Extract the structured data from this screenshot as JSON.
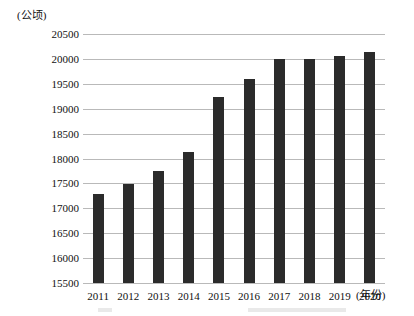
{
  "chart_data": {
    "type": "bar",
    "title": "",
    "xlabel": "(年份)",
    "ylabel": "(公顷)",
    "categories": [
      "2011",
      "2012",
      "2013",
      "2014",
      "2015",
      "2016",
      "2017",
      "2018",
      "2019",
      "2020"
    ],
    "values": [
      17280,
      17490,
      17740,
      18140,
      19230,
      19600,
      19990,
      19990,
      20060,
      20140
    ],
    "ylim": [
      15500,
      20500
    ],
    "ytick_labels": [
      "20500",
      "20000",
      "19500",
      "19000",
      "18500",
      "18000",
      "17500",
      "17000",
      "16500",
      "16000",
      "15500"
    ],
    "ytick_values": [
      20500,
      20000,
      19500,
      19000,
      18500,
      18000,
      17500,
      17000,
      16500,
      16000,
      15500
    ],
    "grid": true,
    "legend": null,
    "bar_color": "#2b2b2b",
    "grid_color": "#b9b9b9"
  },
  "axes": {
    "y_unit": "(公顷)",
    "x_unit": "(年份)"
  }
}
